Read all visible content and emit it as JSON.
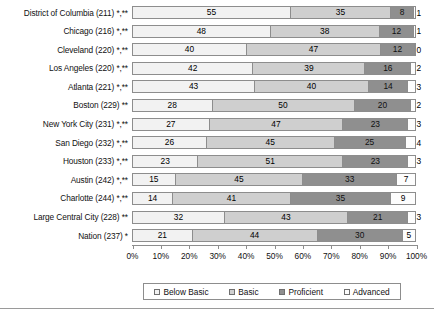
{
  "chart_data": {
    "type": "bar",
    "orientation": "horizontal",
    "stacked": true,
    "stack_mode": "percent",
    "title": "",
    "subtitle": "",
    "xlabel": "",
    "ylabel": "",
    "xlim": [
      0,
      100
    ],
    "grid": false,
    "legend_position": "bottom",
    "axis_tick_labels": [
      "0%",
      "10%",
      "20%",
      "30%",
      "40%",
      "50%",
      "60%",
      "70%",
      "80%",
      "90%",
      "100%"
    ],
    "axis_tick_values": [
      0,
      10,
      20,
      30,
      40,
      50,
      60,
      70,
      80,
      90,
      100
    ],
    "legend": [
      "Below Basic",
      "Basic",
      "Proficient",
      "Advanced"
    ],
    "series": [
      {
        "name": "Below Basic",
        "color": "#f2f2f2",
        "values": [
          55,
          48,
          40,
          42,
          43,
          28,
          27,
          26,
          23,
          15,
          14,
          32,
          21
        ]
      },
      {
        "name": "Basic",
        "color": "#cfcfcf",
        "values": [
          35,
          38,
          47,
          39,
          40,
          50,
          47,
          45,
          51,
          45,
          41,
          43,
          44
        ]
      },
      {
        "name": "Proficient",
        "color": "#8f8f8f",
        "values": [
          8,
          12,
          12,
          16,
          14,
          20,
          23,
          25,
          23,
          33,
          35,
          21,
          30
        ]
      },
      {
        "name": "Advanced",
        "color": "#fdfdfd",
        "values": [
          1,
          1,
          0,
          2,
          3,
          2,
          3,
          4,
          3,
          7,
          9,
          3,
          5
        ]
      }
    ],
    "categories": [
      "District of Columbia (211) *,**",
      "Chicago (216) *,**",
      "Cleveland (220) *,**",
      "Los Angeles (220) *,**",
      "Atlanta (221) *,**",
      "Boston (229) **",
      "New York City (231) *,**",
      "San Diego (232) *,**",
      "Houston (233) *,**",
      "Austin (242) *,**",
      "Charlotte (244) *,**",
      "Large Central City (228) **",
      "Nation (237) *"
    ]
  }
}
